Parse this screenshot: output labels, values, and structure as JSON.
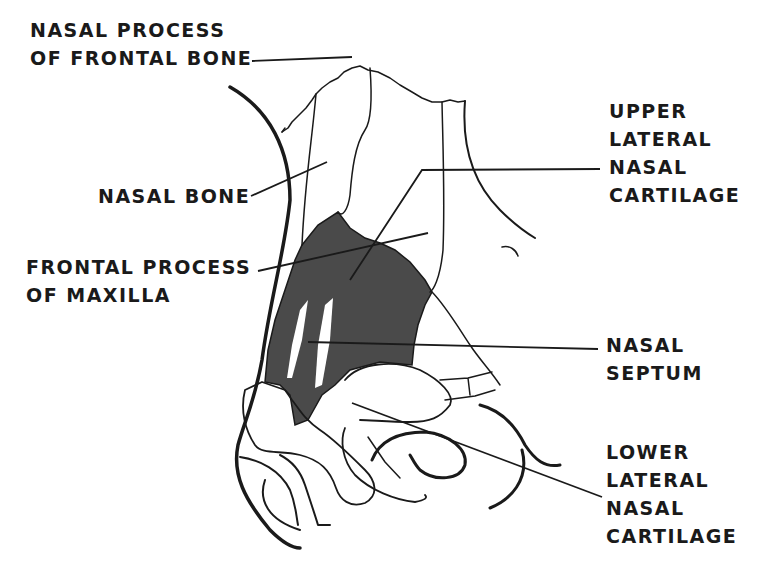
{
  "diagram": {
    "colors": {
      "ink": "#1a1a1a",
      "shaded_region": "#4a4a4a",
      "background": "#ffffff"
    },
    "labels": {
      "nasal_process_frontal_bone": {
        "line1": "NASAL PROCESS",
        "line2": "OF FRONTAL BONE"
      },
      "nasal_bone": {
        "line1": "NASAL BONE"
      },
      "frontal_process_maxilla": {
        "line1": "FRONTAL PROCESS",
        "line2": "OF MAXILLA"
      },
      "upper_lateral_nasal_cartilage": {
        "line1": "UPPER",
        "line2": "LATERAL",
        "line3": "NASAL",
        "line4": "CARTILAGE"
      },
      "nasal_septum": {
        "line1": "NASAL",
        "line2": "SEPTUM"
      },
      "lower_lateral_nasal_cartilage": {
        "line1": "LOWER",
        "line2": "LATERAL",
        "line3": "NASAL",
        "line4": "CARTILAGE"
      }
    }
  }
}
